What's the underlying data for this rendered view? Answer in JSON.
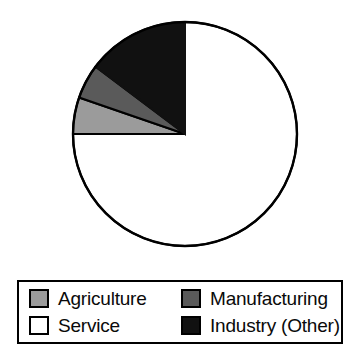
{
  "chart_data": {
    "type": "pie",
    "title": "",
    "subtitle": "",
    "xlabel": "",
    "ylabel": "",
    "grid": false,
    "legend_position": "bottom",
    "start_angle_deg": 90,
    "direction": "counterclockwise",
    "categories": [
      "Industry (Other)",
      "Manufacturing",
      "Agriculture",
      "Service"
    ],
    "values": [
      14.7,
      5.0,
      5.3,
      75.0
    ],
    "units": "percent",
    "slices": [
      {
        "label": "Industry (Other)",
        "value": 14.7,
        "sweep_deg": 53,
        "color": "#111111",
        "swatch_color": "#111111",
        "order": 1
      },
      {
        "label": "Manufacturing",
        "value": 5.0,
        "sweep_deg": 18,
        "color": "#5a5a5a",
        "swatch_color": "#5a5a5a",
        "order": 2
      },
      {
        "label": "Agriculture",
        "value": 5.3,
        "sweep_deg": 19,
        "color": "#9b9b9b",
        "swatch_color": "#9b9b9b",
        "order": 3
      },
      {
        "label": "Service",
        "value": 75.0,
        "sweep_deg": 270,
        "color": "#ffffff",
        "swatch_color": "#ffffff",
        "order": 4
      }
    ]
  },
  "pie": {
    "center_x": 185,
    "center_y": 134,
    "radius": 112,
    "outline_color": "#000000",
    "outline_width": 2,
    "background": "#ffffff"
  },
  "legend": {
    "border_color": "#000000",
    "background": "#ffffff",
    "entries": [
      {
        "label": "Agriculture",
        "swatch": "agriculture-swatch",
        "color": "#9b9b9b"
      },
      {
        "label": "Manufacturing",
        "swatch": "manufacturing-swatch",
        "color": "#5a5a5a"
      },
      {
        "label": "Service",
        "swatch": "service-swatch",
        "color": "#ffffff"
      },
      {
        "label": "Industry (Other)",
        "swatch": "industry-other-swatch",
        "color": "#111111"
      }
    ]
  }
}
